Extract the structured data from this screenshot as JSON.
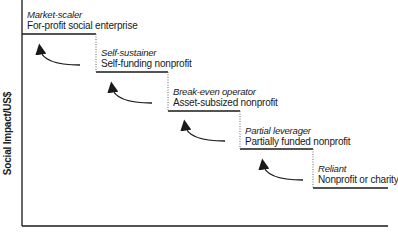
{
  "diagram": {
    "y_axis_label": "Social Impact/US$",
    "steps": [
      {
        "role": "Market-scaler",
        "kind": "For-profit social enterprise"
      },
      {
        "role": "Self-sustainer",
        "kind": "Self-funding nonprofit"
      },
      {
        "role": "Break-even operator",
        "kind": "Asset-subsized nonprofit"
      },
      {
        "role": "Partial leverager",
        "kind": "Partially funded nonprofit"
      },
      {
        "role": "Reliant",
        "kind": "Nonprofit or charity"
      }
    ],
    "colors": {
      "line": "#1a1a1a",
      "background": "#ffffff"
    }
  }
}
